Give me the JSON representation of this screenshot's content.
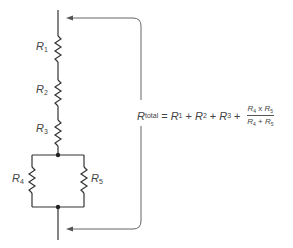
{
  "diagram": {
    "type": "series-parallel resistor circuit",
    "resistors": [
      {
        "id": "R1",
        "label": "R",
        "sub": "1",
        "arrangement": "series"
      },
      {
        "id": "R2",
        "label": "R",
        "sub": "2",
        "arrangement": "series"
      },
      {
        "id": "R3",
        "label": "R",
        "sub": "3",
        "arrangement": "series"
      },
      {
        "id": "R4",
        "label": "R",
        "sub": "4",
        "arrangement": "parallel"
      },
      {
        "id": "R5",
        "label": "R",
        "sub": "5",
        "arrangement": "parallel"
      }
    ],
    "formula": {
      "lhs": "R",
      "lhs_sub": "total",
      "equals": "=",
      "terms": [
        {
          "label": "R",
          "sub": "1"
        },
        {
          "label": "R",
          "sub": "2"
        },
        {
          "label": "R",
          "sub": "3"
        }
      ],
      "plus": "+",
      "fraction": {
        "numerator": {
          "a": "R",
          "a_sub": "4",
          "op": "x",
          "b": "R",
          "b_sub": "5"
        },
        "denominator": {
          "a": "R",
          "a_sub": "4",
          "op": "+",
          "b": "R",
          "b_sub": "5"
        }
      }
    },
    "colors": {
      "line": "#333333",
      "bracket": "#666666",
      "background": "#ffffff"
    }
  }
}
